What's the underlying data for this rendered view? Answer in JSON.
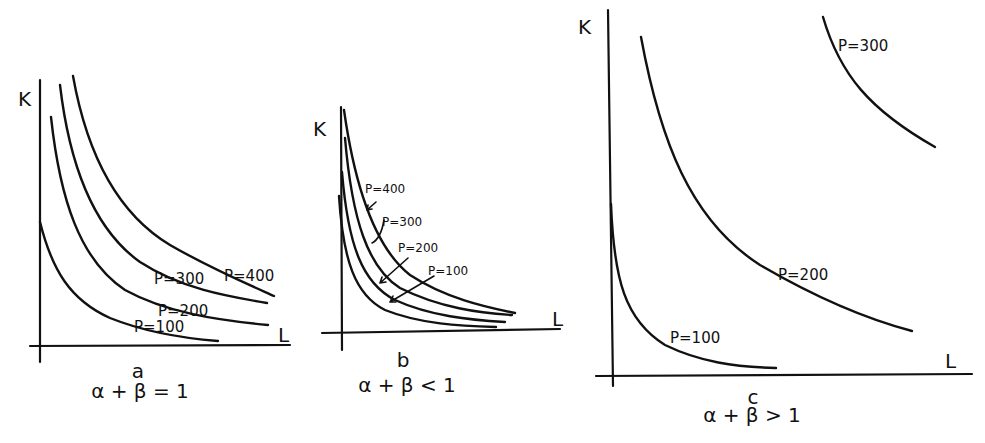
{
  "panels": [
    {
      "id": "a",
      "caption_letter": "a",
      "caption_condition": "α + β = 1",
      "y_axis_label": "K",
      "x_axis_label": "L",
      "curves": [
        {
          "label": "P=100"
        },
        {
          "label": "P=200"
        },
        {
          "label": "P=300"
        },
        {
          "label": "P=400"
        }
      ]
    },
    {
      "id": "b",
      "caption_letter": "b",
      "caption_condition": "α + β < 1",
      "y_axis_label": "K",
      "x_axis_label": "L",
      "curves": [
        {
          "label": "P=100"
        },
        {
          "label": "P=200"
        },
        {
          "label": "P=300"
        },
        {
          "label": "P=400"
        }
      ]
    },
    {
      "id": "c",
      "caption_letter": "c",
      "caption_condition": "α + β > 1",
      "y_axis_label": "K",
      "x_axis_label": "L",
      "curves": [
        {
          "label": "P=100"
        },
        {
          "label": "P=200"
        },
        {
          "label": "P=300"
        }
      ]
    }
  ],
  "colors": {
    "ink": "#111111",
    "background": "#ffffff"
  }
}
